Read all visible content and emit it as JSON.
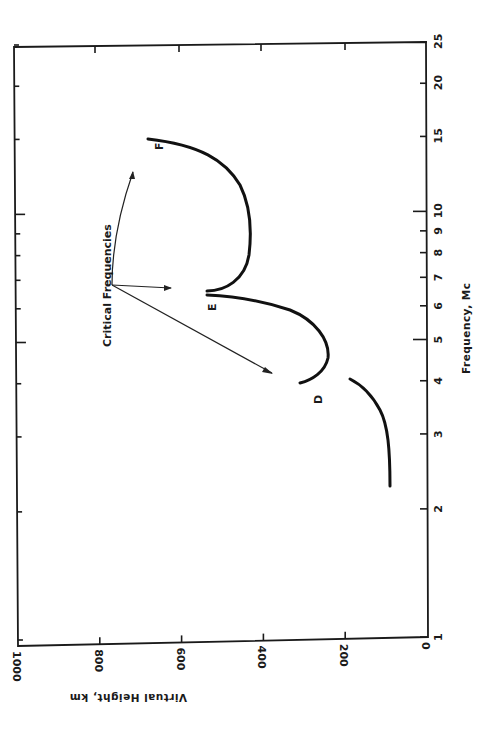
{
  "chart_data": {
    "type": "line",
    "orientation": "rotated-90-clockwise",
    "title": "",
    "xlabel": "Frequency, Mc",
    "ylabel": "Virtual Height, km",
    "xscale": "log",
    "xlim": [
      1,
      25
    ],
    "ylim": [
      0,
      1000
    ],
    "x_ticks": [
      "1",
      "2",
      "3",
      "4",
      "5",
      "6",
      "7",
      "8",
      "9",
      "10",
      "15",
      "20",
      "25"
    ],
    "y_ticks": [
      "0",
      "200",
      "400",
      "600",
      "800",
      "1000"
    ],
    "grid": false,
    "series": [
      {
        "name": "Lower trace (D region)",
        "x": [
          2.3,
          2.6,
          3.0,
          3.4,
          3.7,
          3.9,
          4.0
        ],
        "y": [
          100,
          102,
          108,
          125,
          150,
          175,
          195
        ]
      },
      {
        "name": "D",
        "x": [
          3.95,
          4.2,
          4.5,
          4.9,
          5.4,
          5.9,
          6.4
        ],
        "y": [
          320,
          275,
          260,
          275,
          330,
          420,
          550
        ]
      },
      {
        "name": "E",
        "x": [
          6.5,
          6.8,
          7.3,
          8.0,
          9.0,
          10.0,
          11.5,
          13.0,
          15.0
        ],
        "y": [
          545,
          480,
          440,
          425,
          430,
          450,
          510,
          590,
          680
        ]
      }
    ],
    "annotations": [
      {
        "text": "D",
        "x": 3.7,
        "y": 300
      },
      {
        "text": "E",
        "x": 6.0,
        "y": 545
      },
      {
        "text": "F",
        "x": 14.5,
        "y": 650
      },
      {
        "text": "Critical Frequencies",
        "points_to": [
          4.3,
          6.6,
          12.5
        ]
      }
    ]
  },
  "axis": {
    "freq_label": "Frequency, Mc",
    "height_label": "Virtual Height, km",
    "freq_ticks": [
      "1",
      "2",
      "3",
      "4",
      "5",
      "6",
      "7",
      "8",
      "9",
      "10",
      "15",
      "20",
      "25"
    ],
    "height_ticks": [
      "0",
      "200",
      "400",
      "600",
      "800",
      "1000"
    ]
  },
  "labels": {
    "d": "D",
    "e": "E",
    "f": "F",
    "critical": "Critical Frequencies"
  }
}
